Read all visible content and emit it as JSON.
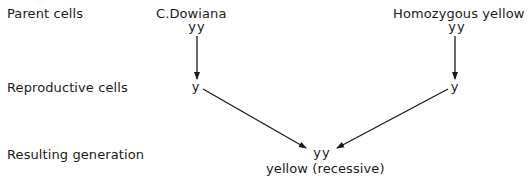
{
  "rows": {
    "parent": "Parent cells",
    "reproductive": "Reproductive cells",
    "resulting": "Resulting generation"
  },
  "left_parent": {
    "name": "C.Dowiana",
    "genotype": "yy",
    "gamete": "y"
  },
  "right_parent": {
    "name": "Homozygous yellow",
    "genotype": "yy",
    "gamete": "y"
  },
  "offspring": {
    "genotype": "yy",
    "phenotype": "yellow (recessive)"
  },
  "colors": {
    "ink": "#1a1a1a",
    "background": "#ffffff"
  }
}
